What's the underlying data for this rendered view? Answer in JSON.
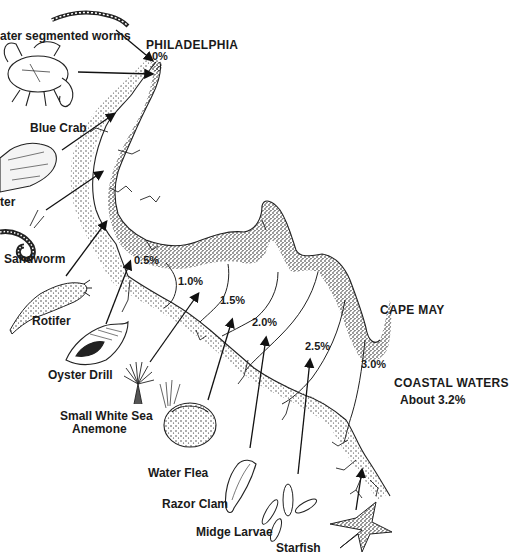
{
  "diagram": {
    "places": {
      "philadelphia": "PHILADELPHIA",
      "cape_may": "CAPE MAY",
      "coastal_waters": "COASTAL WATERS",
      "coastal_salinity": "About 3.2%"
    },
    "salinity_lines": [
      {
        "label": "0%"
      },
      {
        "label": "0.5%"
      },
      {
        "label": "1.0%"
      },
      {
        "label": "1.5%"
      },
      {
        "label": "2.0%"
      },
      {
        "label": "2.5%"
      },
      {
        "label": "3.0%"
      }
    ],
    "organisms": [
      {
        "label": "Freshwater segmented worms",
        "visible_text": "ater segmented worms"
      },
      {
        "label": "Blue Crab",
        "visible_text": "Blue Crab"
      },
      {
        "label": "Oyster",
        "visible_text": "ter"
      },
      {
        "label": "Sandworm",
        "visible_text": "Sandworm"
      },
      {
        "label": "Rotifer",
        "visible_text": "Rotifer"
      },
      {
        "label": "Oyster Drill",
        "visible_text": "Oyster Drill"
      },
      {
        "label": "Small White Sea Anemone",
        "visible_text_line1": "Small White Sea",
        "visible_text_line2": "Anemone"
      },
      {
        "label": "Water Flea",
        "visible_text": "Water Flea"
      },
      {
        "label": "Razor Clam",
        "visible_text": "Razor Clam"
      },
      {
        "label": "Midge Larvae",
        "visible_text": "Midge Larvae"
      },
      {
        "label": "Starfish",
        "visible_text": "Starfish"
      }
    ],
    "colors": {
      "background": "#ffffff",
      "ink": "#1a1a1a"
    }
  }
}
